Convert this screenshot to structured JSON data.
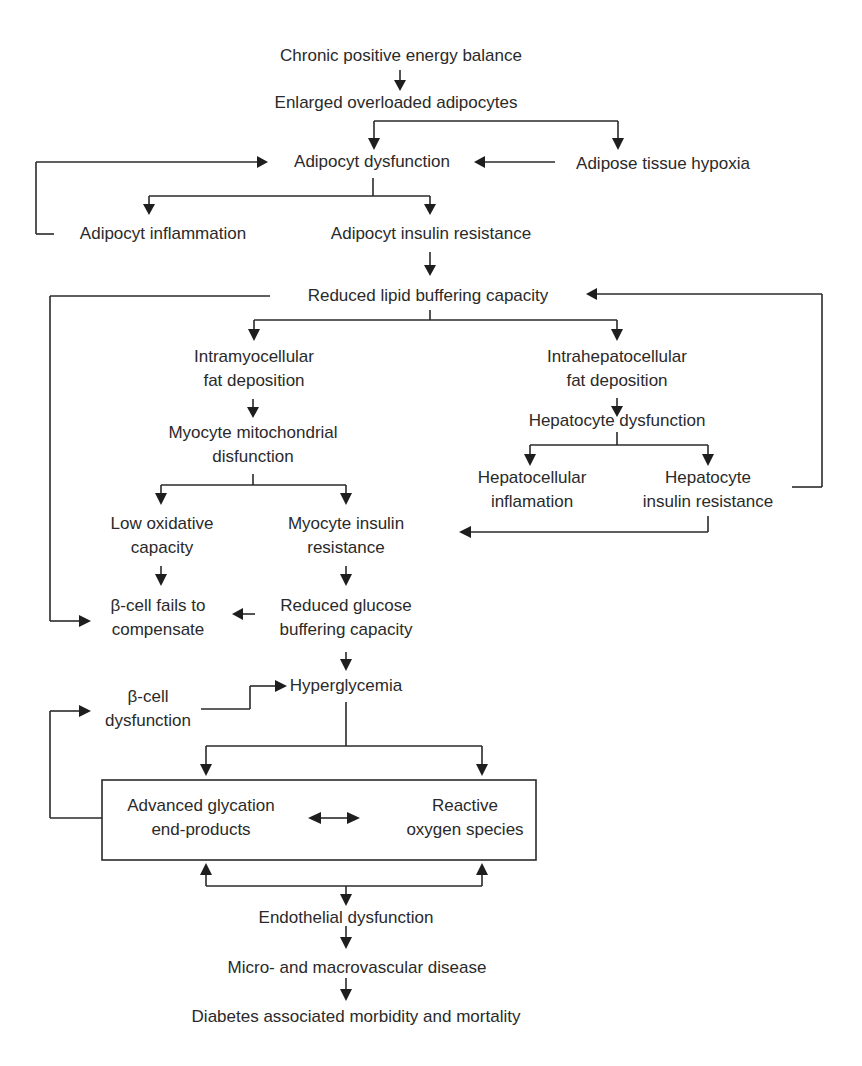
{
  "diagram": {
    "type": "flowchart",
    "topic": "Pathway from chronic positive energy balance to diabetes associated morbidity and mortality",
    "colors": {
      "ink": "#2a2a2a",
      "background": "#ffffff"
    },
    "nodes": {
      "chronic_positive_energy_balance": {
        "lines": [
          "Chronic positive energy balance"
        ]
      },
      "enlarged_overloaded_adipocytes": {
        "lines": [
          "Enlarged overloaded adipocytes"
        ]
      },
      "adipocyt_dysfunction": {
        "lines": [
          "Adipocyt dysfunction"
        ]
      },
      "adipose_tissue_hypoxia": {
        "lines": [
          "Adipose tissue hypoxia"
        ]
      },
      "adipocyt_inflammation": {
        "lines": [
          "Adipocyt inflammation"
        ]
      },
      "adipocyt_insulin_resistance": {
        "lines": [
          "Adipocyt insulin resistance"
        ]
      },
      "reduced_lipid_buffering_capacity": {
        "lines": [
          "Reduced lipid buffering capacity"
        ]
      },
      "intramyocellular_fat_deposition": {
        "lines": [
          "Intramyocellular",
          "fat deposition"
        ]
      },
      "intrahepatocellular_fat_deposition": {
        "lines": [
          "Intrahepatocellular",
          "fat deposition"
        ]
      },
      "myocyte_mitochondrial_disfunction": {
        "lines": [
          "Myocyte mitochondrial",
          "disfunction"
        ]
      },
      "hepatocyte_dysfunction": {
        "lines": [
          "Hepatocyte dysfunction"
        ]
      },
      "hepatocellular_inflamation": {
        "lines": [
          "Hepatocellular",
          "inflamation"
        ]
      },
      "hepatocyte_insulin_resistance": {
        "lines": [
          "Hepatocyte",
          "insulin resistance"
        ]
      },
      "low_oxidative_capacity": {
        "lines": [
          "Low oxidative",
          "capacity"
        ]
      },
      "myocyte_insulin_resistance": {
        "lines": [
          "Myocyte insulin",
          "resistance"
        ]
      },
      "beta_cell_fails_to_compensate": {
        "lines": [
          "β-cell fails to",
          "compensate"
        ]
      },
      "reduced_glucose_buffering_capacity": {
        "lines": [
          "Reduced glucose",
          "buffering capacity"
        ]
      },
      "beta_cell_dysfunction": {
        "lines": [
          "β-cell",
          "dysfunction"
        ]
      },
      "hyperglycemia": {
        "lines": [
          "Hyperglycemia"
        ]
      },
      "advanced_glycation_end_products": {
        "lines": [
          "Advanced glycation",
          "end-products"
        ]
      },
      "reactive_oxygen_species": {
        "lines": [
          "Reactive",
          "oxygen species"
        ]
      },
      "endothelial_dysfunction": {
        "lines": [
          "Endothelial dysfunction"
        ]
      },
      "micro_and_macrovascular_disease": {
        "lines": [
          "Micro- and macrovascular disease"
        ]
      },
      "diabetes_associated_morbidity_and_mortality": {
        "lines": [
          "Diabetes associated morbidity and mortality"
        ]
      }
    },
    "edges": [
      {
        "from": "chronic_positive_energy_balance",
        "to": "enlarged_overloaded_adipocytes"
      },
      {
        "from": "enlarged_overloaded_adipocytes",
        "to": "adipocyt_dysfunction"
      },
      {
        "from": "enlarged_overloaded_adipocytes",
        "to": "adipose_tissue_hypoxia"
      },
      {
        "from": "adipose_tissue_hypoxia",
        "to": "adipocyt_dysfunction"
      },
      {
        "from": "adipocyt_dysfunction",
        "to": "adipocyt_inflammation"
      },
      {
        "from": "adipocyt_dysfunction",
        "to": "adipocyt_insulin_resistance"
      },
      {
        "from": "adipocyt_inflammation",
        "to": "adipocyt_dysfunction",
        "note": "feedback loop"
      },
      {
        "from": "adipocyt_insulin_resistance",
        "to": "reduced_lipid_buffering_capacity"
      },
      {
        "from": "reduced_lipid_buffering_capacity",
        "to": "intramyocellular_fat_deposition"
      },
      {
        "from": "reduced_lipid_buffering_capacity",
        "to": "intrahepatocellular_fat_deposition"
      },
      {
        "from": "reduced_lipid_buffering_capacity",
        "to": "beta_cell_fails_to_compensate"
      },
      {
        "from": "intramyocellular_fat_deposition",
        "to": "myocyte_mitochondrial_disfunction"
      },
      {
        "from": "myocyte_mitochondrial_disfunction",
        "to": "low_oxidative_capacity"
      },
      {
        "from": "myocyte_mitochondrial_disfunction",
        "to": "myocyte_insulin_resistance"
      },
      {
        "from": "intrahepatocellular_fat_deposition",
        "to": "hepatocyte_dysfunction"
      },
      {
        "from": "hepatocyte_dysfunction",
        "to": "hepatocellular_inflamation"
      },
      {
        "from": "hepatocyte_dysfunction",
        "to": "hepatocyte_insulin_resistance"
      },
      {
        "from": "hepatocyte_insulin_resistance",
        "to": "reduced_lipid_buffering_capacity",
        "note": "feedback loop"
      },
      {
        "from": "hepatocyte_insulin_resistance",
        "to": "myocyte_insulin_resistance"
      },
      {
        "from": "low_oxidative_capacity",
        "to": "beta_cell_fails_to_compensate"
      },
      {
        "from": "myocyte_insulin_resistance",
        "to": "reduced_glucose_buffering_capacity"
      },
      {
        "from": "reduced_glucose_buffering_capacity",
        "to": "beta_cell_fails_to_compensate"
      },
      {
        "from": "reduced_glucose_buffering_capacity",
        "to": "hyperglycemia"
      },
      {
        "from": "beta_cell_dysfunction",
        "to": "hyperglycemia"
      },
      {
        "from": "hyperglycemia",
        "to": "advanced_glycation_end_products"
      },
      {
        "from": "hyperglycemia",
        "to": "reactive_oxygen_species"
      },
      {
        "from": "advanced_glycation_end_products",
        "to": "reactive_oxygen_species",
        "bidirectional": true
      },
      {
        "from": "advanced_glycation_end_products",
        "to": "beta_cell_dysfunction",
        "note": "feedback loop"
      },
      {
        "from": "endothelial_dysfunction",
        "to": "advanced_glycation_end_products"
      },
      {
        "from": "endothelial_dysfunction",
        "to": "reactive_oxygen_species"
      },
      {
        "from": "advanced_glycation_end_products",
        "to": "endothelial_dysfunction"
      },
      {
        "from": "endothelial_dysfunction",
        "to": "micro_and_macrovascular_disease"
      },
      {
        "from": "micro_and_macrovascular_disease",
        "to": "diabetes_associated_morbidity_and_mortality"
      }
    ]
  }
}
